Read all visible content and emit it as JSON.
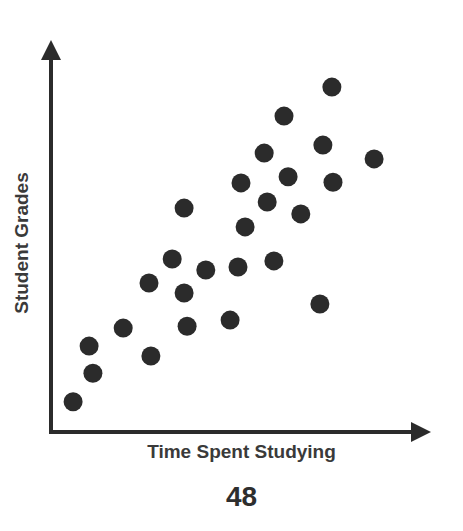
{
  "chart_data": {
    "type": "scatter",
    "title": "",
    "xlabel": "Time Spent Studying",
    "ylabel": "Student Grades",
    "xlim": [
      0,
      100
    ],
    "ylim": [
      0,
      100
    ],
    "grid": false,
    "legend": null,
    "ticks": "none",
    "annotations": [
      "48"
    ],
    "series": [
      {
        "name": "students",
        "color": "#2b2b2b",
        "points": [
          {
            "x": 5.9,
            "y": 7.9
          },
          {
            "x": 11.2,
            "y": 15.4
          },
          {
            "x": 10.2,
            "y": 22.5
          },
          {
            "x": 19.3,
            "y": 27.2
          },
          {
            "x": 26.7,
            "y": 19.9
          },
          {
            "x": 26.2,
            "y": 39.0
          },
          {
            "x": 35.6,
            "y": 36.4
          },
          {
            "x": 32.4,
            "y": 45.3
          },
          {
            "x": 36.4,
            "y": 27.7
          },
          {
            "x": 41.4,
            "y": 42.4
          },
          {
            "x": 47.9,
            "y": 29.3
          },
          {
            "x": 50.0,
            "y": 43.2
          },
          {
            "x": 35.6,
            "y": 58.6
          },
          {
            "x": 51.9,
            "y": 53.7
          },
          {
            "x": 59.6,
            "y": 44.8
          },
          {
            "x": 71.9,
            "y": 33.5
          },
          {
            "x": 57.8,
            "y": 60.2
          },
          {
            "x": 50.8,
            "y": 65.2
          },
          {
            "x": 63.4,
            "y": 66.8
          },
          {
            "x": 66.8,
            "y": 57.1
          },
          {
            "x": 57.0,
            "y": 73.0
          },
          {
            "x": 75.4,
            "y": 65.4
          },
          {
            "x": 72.7,
            "y": 75.1
          },
          {
            "x": 62.3,
            "y": 82.7
          },
          {
            "x": 86.4,
            "y": 71.5
          },
          {
            "x": 75.1,
            "y": 90.3
          }
        ]
      }
    ]
  },
  "labels": {
    "x_axis": "Time Spent Studying",
    "y_axis": "Student Grades",
    "page_number": "48"
  },
  "colors": {
    "axis": "#2b2b2b",
    "point": "#2b2b2b",
    "text": "#3a3a3a"
  }
}
